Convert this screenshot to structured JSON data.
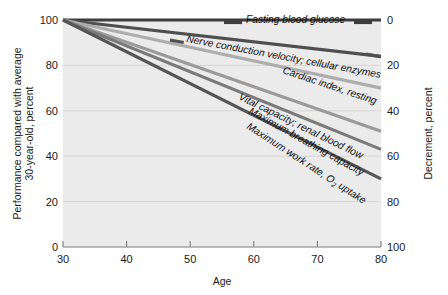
{
  "chart_data": {
    "type": "line",
    "title": "",
    "xlabel": "Age",
    "ylabel": "Performance compared with average 30-year-old, percent",
    "ylabel_line1": "Performance compared with average",
    "ylabel_line2": "30-year-old, percent",
    "ylabel_right": "Decrement, percent",
    "xlim": [
      30,
      80
    ],
    "ylim": [
      0,
      100
    ],
    "ylim_right": [
      100,
      0
    ],
    "xticks": [
      "30",
      "40",
      "50",
      "60",
      "70",
      "80"
    ],
    "xtick_values": [
      30,
      40,
      50,
      60,
      70,
      80
    ],
    "yticks": [
      "0",
      "20",
      "40",
      "60",
      "80",
      "100"
    ],
    "ytick_values": [
      0,
      20,
      40,
      60,
      80,
      100
    ],
    "yticks_right": [
      "0",
      "20",
      "40",
      "60",
      "80",
      "100"
    ],
    "ytick_right_values": [
      0,
      20,
      40,
      60,
      80,
      100
    ],
    "grid": true,
    "grid_axis": "y",
    "legend": "inline-labels",
    "background": "#ebebeb",
    "x": [
      30,
      80
    ],
    "series": [
      {
        "name": "Fasting blood glucose",
        "label": "Fasting blood glucose",
        "values": [
          100,
          100
        ],
        "decrement": [
          0,
          0
        ],
        "color": "#3d3d3d",
        "label_angle": 0,
        "label_x": 246,
        "label_y": 22.5,
        "anchor": "start"
      },
      {
        "name": "Nerve conduction velocity; cellular enzymes",
        "label": "Nerve conduction velocity; cellular enzymes",
        "values": [
          100,
          84
        ],
        "decrement": [
          0,
          16
        ],
        "color": "#4f4f4f",
        "label_angle": 10.5,
        "label_x": 186,
        "label_y": 42,
        "anchor": "start"
      },
      {
        "name": "Cardiac index, resting",
        "label": "Cardiac index, resting",
        "values": [
          100,
          70
        ],
        "decrement": [
          0,
          30
        ],
        "color": "#adadad",
        "label_angle": 18.5,
        "label_x": 282,
        "label_y": 73,
        "anchor": "start"
      },
      {
        "name": "Vital capacity; renal blood flow",
        "label": "Vital capacity; renal blood flow",
        "values": [
          100,
          51
        ],
        "decrement": [
          0,
          49
        ],
        "color": "#9a9a9a",
        "label_angle": 26,
        "label_x": 238,
        "label_y": 99,
        "anchor": "start"
      },
      {
        "name": "Maximum breathing capacity",
        "label": "Maximum breathing capacity",
        "values": [
          100,
          43
        ],
        "decrement": [
          0,
          57
        ],
        "color": "#7a7a7a",
        "label_angle": 29,
        "label_x": 248,
        "label_y": 113,
        "anchor": "start"
      },
      {
        "name": "Maximum work rate, O2 uptake",
        "label_part1": "Maximum work rate, O",
        "label_sub": "2",
        "label_part2": " uptake",
        "values": [
          100,
          30
        ],
        "decrement": [
          0,
          70
        ],
        "color": "#565656",
        "label_angle": 33,
        "label_x": 246,
        "label_y": 128,
        "anchor": "start"
      }
    ]
  }
}
